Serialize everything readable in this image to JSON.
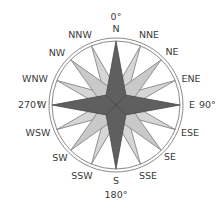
{
  "diagram": {
    "type": "compass-rose",
    "center": {
      "x": 116,
      "y": 105
    },
    "radius": 67,
    "colors": {
      "cardinal": "#5f5f5f",
      "intercardinal": "#c9c9c9",
      "secondary": "#d6d6d6",
      "outline": "#7a7a7a",
      "ring": "#8a8a8a",
      "text": "#3a3a3a"
    },
    "degree_labels": {
      "north": "0°",
      "east": "90°",
      "south": "180°",
      "west": "270°"
    },
    "directions": [
      {
        "label": "N",
        "angle": 0
      },
      {
        "label": "NNE",
        "angle": 22.5
      },
      {
        "label": "NE",
        "angle": 45
      },
      {
        "label": "ENE",
        "angle": 67.5
      },
      {
        "label": "E",
        "angle": 90
      },
      {
        "label": "ESE",
        "angle": 112.5
      },
      {
        "label": "SE",
        "angle": 135
      },
      {
        "label": "SSE",
        "angle": 157.5
      },
      {
        "label": "S",
        "angle": 180
      },
      {
        "label": "SSW",
        "angle": 202.5
      },
      {
        "label": "SW",
        "angle": 225
      },
      {
        "label": "WSW",
        "angle": 247.5
      },
      {
        "label": "W",
        "angle": 270
      },
      {
        "label": "WNW",
        "angle": 292.5
      },
      {
        "label": "NW",
        "angle": 315
      },
      {
        "label": "NNW",
        "angle": 337.5
      }
    ]
  }
}
